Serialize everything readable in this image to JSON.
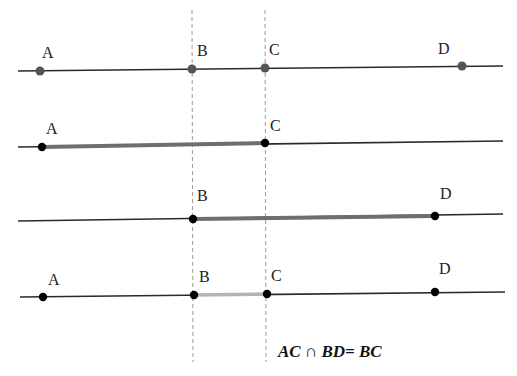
{
  "diagram": {
    "type": "segment-intersection",
    "colors": {
      "line": "#2a2a2a",
      "guide": "#9a9a9a",
      "dot_gray": "#555555",
      "dot_black": "#000000",
      "thick_segment": "#6e6e6e",
      "highlight_segment": "#b4b4b4"
    },
    "guides": [
      {
        "name": "guide-through-B",
        "x1": 192,
        "y1": 10,
        "x2": 193,
        "y2": 362
      },
      {
        "name": "guide-through-C",
        "x1": 265,
        "y1": 10,
        "x2": 266,
        "y2": 362
      }
    ],
    "rows": [
      {
        "name": "row-all-points",
        "line": {
          "x1": 18,
          "y1": 71,
          "x2": 503,
          "y2": 66
        },
        "segment": null,
        "dot_style": "gray",
        "points": [
          {
            "label": "A",
            "x": 40,
            "y": 71,
            "lx": 42,
            "ly": 58
          },
          {
            "label": "B",
            "x": 192,
            "y": 69,
            "lx": 197,
            "ly": 56
          },
          {
            "label": "C",
            "x": 265,
            "y": 68,
            "lx": 269,
            "ly": 55
          },
          {
            "label": "D",
            "x": 462,
            "y": 66,
            "lx": 438,
            "ly": 54
          }
        ]
      },
      {
        "name": "row-segment-AC",
        "line": {
          "x1": 18,
          "y1": 147,
          "x2": 503,
          "y2": 141
        },
        "segment": {
          "from": "A",
          "to": "C",
          "style": "thick"
        },
        "dot_style": "black",
        "points": [
          {
            "label": "A",
            "x": 42,
            "y": 147,
            "lx": 46,
            "ly": 134
          },
          {
            "label": "C",
            "x": 265,
            "y": 143,
            "lx": 270,
            "ly": 131
          }
        ]
      },
      {
        "name": "row-segment-BD",
        "line": {
          "x1": 18,
          "y1": 221,
          "x2": 503,
          "y2": 214
        },
        "segment": {
          "from": "B",
          "to": "D",
          "style": "thick"
        },
        "dot_style": "black",
        "points": [
          {
            "label": "B",
            "x": 193,
            "y": 219,
            "lx": 197,
            "ly": 201
          },
          {
            "label": "D",
            "x": 435,
            "y": 216,
            "lx": 440,
            "ly": 199
          }
        ]
      },
      {
        "name": "row-intersection-BC",
        "line": {
          "x1": 20,
          "y1": 297,
          "x2": 505,
          "y2": 292
        },
        "segment": {
          "from": "B",
          "to": "C",
          "style": "highlight"
        },
        "dot_style": "black",
        "points": [
          {
            "label": "A",
            "x": 43,
            "y": 297,
            "lx": 48,
            "ly": 285
          },
          {
            "label": "B",
            "x": 194,
            "y": 295,
            "lx": 199,
            "ly": 282
          },
          {
            "label": "C",
            "x": 267,
            "y": 294,
            "lx": 271,
            "ly": 281
          },
          {
            "label": "D",
            "x": 435,
            "y": 292,
            "lx": 439,
            "ly": 274
          }
        ]
      }
    ],
    "formula": {
      "text": "AC ∩ BD= BC",
      "x": 278,
      "y": 357
    }
  }
}
